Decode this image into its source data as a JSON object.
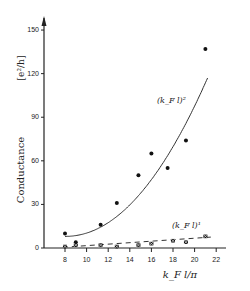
{
  "chart_data": {
    "type": "scatter",
    "title": "",
    "xlabel": "k_F l/π",
    "ylabel": "Conductance",
    "ylabel_unit": "[e²/h]",
    "xlim": [
      6,
      23
    ],
    "ylim": [
      0,
      150
    ],
    "xticks": [
      8,
      10,
      12,
      14,
      16,
      18,
      20,
      22
    ],
    "yticks": [
      0,
      30,
      60,
      90,
      120,
      150
    ],
    "grid": false,
    "series": [
      {
        "name": "(k_F l)^2",
        "marker": "filled-circle",
        "points": [
          [
            8,
            10
          ],
          [
            9,
            4
          ],
          [
            11.3,
            16
          ],
          [
            12.8,
            31
          ],
          [
            14.8,
            50
          ],
          [
            16,
            65
          ],
          [
            17.5,
            55
          ],
          [
            19.2,
            74
          ],
          [
            21,
            137
          ]
        ],
        "fit": "quadratic",
        "fit_line": "solid"
      },
      {
        "name": "(k_F l)^1",
        "marker": "x-square",
        "points": [
          [
            8,
            1
          ],
          [
            9,
            2
          ],
          [
            11.3,
            2
          ],
          [
            12.8,
            1
          ],
          [
            14.8,
            2
          ],
          [
            16,
            3
          ],
          [
            18,
            5
          ],
          [
            19.2,
            4
          ],
          [
            21,
            8
          ]
        ],
        "fit": "linear",
        "fit_line": "dashed"
      }
    ],
    "annotations": [
      {
        "text": "(k_F l)²",
        "near_series": "(k_F l)^2"
      },
      {
        "text": "(k_F l)¹",
        "near_series": "(k_F l)^1"
      }
    ]
  },
  "labels": {
    "ylabel": "Conductance",
    "yunit": "[e²/h]",
    "xlabel": "k_F l/π",
    "curve2": "(k_F l)²",
    "curve1": "(k_F l)¹"
  }
}
